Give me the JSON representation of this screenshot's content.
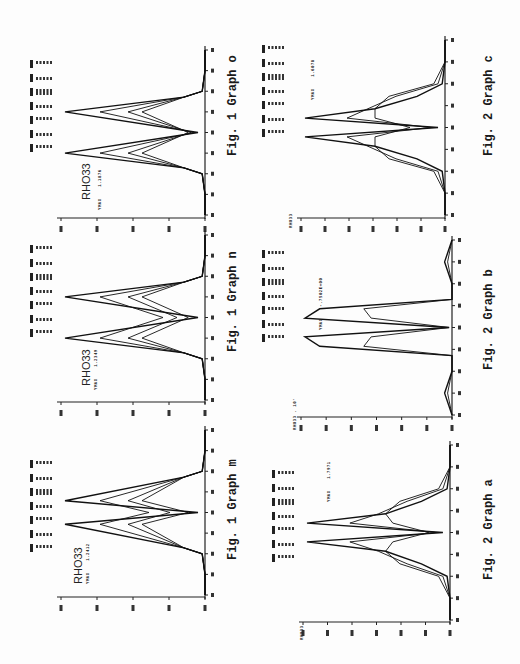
{
  "page": {
    "orientation": "rotated-90-ccw"
  },
  "figures": [
    {
      "id": "fig1-o",
      "caption": "Fig. 1 Graph o",
      "label": "RHO33",
      "value_label": "YMAX",
      "value": "1.1876",
      "x_axis_label": "DM. 10'"
    },
    {
      "id": "fig1-n",
      "caption": "Fig. 1 Graph n",
      "label": "RHO33",
      "value_label": "YMAX",
      "value": "1.2349",
      "x_axis_label": "DM. 10'"
    },
    {
      "id": "fig1-m",
      "caption": "Fig. 1 Graph m",
      "label": "RHO33",
      "value_label": "YMAX",
      "value": "1.2412",
      "x_axis_label": "DM. 10'"
    },
    {
      "id": "fig2-c",
      "caption": "Fig. 2 Graph c",
      "label": "RHO33",
      "value_label": "YMAX",
      "value": "1.6078",
      "x_axis_label": "DM. 10'"
    },
    {
      "id": "fig2-b",
      "caption": "Fig. 2 Graph b",
      "label": "RHO33 . 10'",
      "value_label": "YMAX",
      "value": "-.7502E+00",
      "x_axis_label": "DM. 10'"
    },
    {
      "id": "fig2-a",
      "caption": "Fig. 2 Graph a",
      "label": "RHO33",
      "value_label": "YMAX",
      "value": "1.7971",
      "x_axis_label": "DM. 10'"
    }
  ],
  "chart_data": [
    {
      "type": "line",
      "title": "Fig. 1 Graph o",
      "xlabel": "DM. 10'",
      "ylabel": "RHO33",
      "x": [
        -1.4,
        -1.05,
        -0.7,
        -0.6,
        -0.35,
        0,
        0.35,
        0.6,
        0.7,
        1.05,
        1.4
      ],
      "series": [
        {
          "name": "curve-1",
          "values": [
            0,
            0,
            0.02,
            0.15,
            1.0,
            0.05,
            1.0,
            0.15,
            0.02,
            0,
            0
          ]
        },
        {
          "name": "curve-2",
          "values": [
            0,
            0,
            0.02,
            0.15,
            0.75,
            0.08,
            0.75,
            0.15,
            0.02,
            0,
            0
          ]
        },
        {
          "name": "curve-3",
          "values": [
            0,
            0,
            0.02,
            0.15,
            0.55,
            0.1,
            0.55,
            0.15,
            0.02,
            0,
            0
          ]
        },
        {
          "name": "curve-4",
          "values": [
            0,
            0,
            0.02,
            0.15,
            0.45,
            0.12,
            0.45,
            0.15,
            0.02,
            0,
            0
          ]
        }
      ],
      "ylim": [
        0,
        1.2
      ],
      "grid": false
    },
    {
      "type": "line",
      "title": "Fig. 1 Graph n",
      "xlabel": "DM. 10'",
      "ylabel": "RHO33",
      "x": [
        -1.4,
        -1.05,
        -0.7,
        -0.6,
        -0.35,
        0,
        0.35,
        0.6,
        0.7,
        1.05,
        1.4
      ],
      "series": [
        {
          "name": "curve-1",
          "values": [
            0,
            0,
            0.02,
            0.15,
            1.0,
            0.05,
            1.0,
            0.15,
            0.02,
            0,
            0
          ]
        },
        {
          "name": "curve-2",
          "values": [
            0,
            0,
            0.02,
            0.15,
            0.75,
            0.3,
            0.75,
            0.15,
            0.02,
            0,
            0
          ]
        },
        {
          "name": "curve-3",
          "values": [
            0,
            0,
            0.02,
            0.15,
            0.55,
            0.2,
            0.55,
            0.15,
            0.02,
            0,
            0
          ]
        },
        {
          "name": "curve-4",
          "values": [
            0,
            0,
            0.02,
            0.15,
            0.45,
            0.12,
            0.45,
            0.15,
            0.02,
            0,
            0
          ]
        }
      ],
      "ylim": [
        0,
        1.2
      ],
      "grid": false
    },
    {
      "type": "line",
      "title": "Fig. 1 Graph m",
      "xlabel": "DM. 10'",
      "ylabel": "RHO33",
      "x": [
        -1.4,
        -1.05,
        -0.7,
        -0.6,
        -0.2,
        0,
        0.2,
        0.6,
        0.7,
        1.05,
        1.4
      ],
      "series": [
        {
          "name": "curve-1",
          "values": [
            0,
            0,
            0.02,
            0.15,
            1.0,
            0.05,
            1.0,
            0.15,
            0.02,
            0,
            0
          ]
        },
        {
          "name": "curve-2",
          "values": [
            0,
            0,
            0.02,
            0.15,
            0.75,
            0.4,
            0.75,
            0.15,
            0.02,
            0,
            0
          ]
        },
        {
          "name": "curve-3",
          "values": [
            0,
            0,
            0.02,
            0.15,
            0.55,
            0.25,
            0.55,
            0.15,
            0.02,
            0,
            0
          ]
        },
        {
          "name": "curve-4",
          "values": [
            0,
            0,
            0.02,
            0.15,
            0.45,
            0.12,
            0.45,
            0.15,
            0.02,
            0,
            0
          ]
        }
      ],
      "ylim": [
        0,
        1.2
      ],
      "grid": false
    },
    {
      "type": "line",
      "title": "Fig. 2 Graph c",
      "xlabel": "DM. 10'",
      "ylabel": "RHO33",
      "x": [
        -1.4,
        -1.05,
        -0.7,
        -0.5,
        -0.3,
        -0.15,
        0,
        0.15,
        0.3,
        0.5,
        0.7,
        1.05,
        1.4
      ],
      "series": [
        {
          "name": "curve-1",
          "values": [
            0,
            0,
            0.02,
            0.2,
            0.5,
            1.0,
            0.05,
            1.0,
            0.5,
            0.2,
            0.02,
            0,
            0
          ]
        },
        {
          "name": "curve-2",
          "values": [
            0,
            0,
            0.05,
            0.35,
            0.55,
            0.7,
            0.1,
            0.7,
            0.55,
            0.35,
            0.05,
            0,
            0
          ]
        },
        {
          "name": "curve-3",
          "values": [
            0,
            0,
            0.08,
            0.4,
            0.5,
            0.5,
            0.25,
            0.5,
            0.5,
            0.4,
            0.08,
            0,
            0
          ]
        }
      ],
      "ylim": [
        0,
        1.6
      ],
      "grid": false
    },
    {
      "type": "line",
      "title": "Fig. 2 Graph b",
      "xlabel": "DM. 10'",
      "ylabel": "RHO33 . 10'",
      "x": [
        -1.4,
        -1.05,
        -0.7,
        -0.45,
        -0.3,
        -0.15,
        0,
        0.15,
        0.3,
        0.45,
        0.7,
        1.05,
        1.4
      ],
      "series": [
        {
          "name": "curve-1",
          "values": [
            0,
            0.05,
            0,
            0,
            0.9,
            1.0,
            0.02,
            1.0,
            0.9,
            0,
            0,
            0.05,
            0
          ]
        },
        {
          "name": "curve-2",
          "values": [
            0,
            0.03,
            0,
            0,
            0.6,
            0.55,
            0.02,
            0.55,
            0.6,
            0,
            0,
            0.03,
            0
          ]
        }
      ],
      "ylim": [
        0,
        1.0
      ],
      "grid": false
    },
    {
      "type": "line",
      "title": "Fig. 2 Graph a",
      "xlabel": "DM. 10'",
      "ylabel": "RHO33",
      "x": [
        -1.4,
        -1.05,
        -0.7,
        -0.5,
        -0.3,
        -0.15,
        0,
        0.15,
        0.3,
        0.5,
        0.7,
        1.05,
        1.4
      ],
      "series": [
        {
          "name": "curve-1",
          "values": [
            0,
            0,
            0.02,
            0.2,
            0.45,
            1.0,
            0.05,
            1.0,
            0.45,
            0.2,
            0.02,
            0,
            0
          ]
        },
        {
          "name": "curve-2",
          "values": [
            0,
            0,
            0.05,
            0.3,
            0.5,
            0.7,
            0.1,
            0.7,
            0.5,
            0.3,
            0.05,
            0,
            0
          ]
        },
        {
          "name": "curve-3",
          "values": [
            0,
            0,
            0.08,
            0.35,
            0.45,
            0.4,
            0.15,
            0.4,
            0.45,
            0.35,
            0.08,
            0,
            0
          ]
        }
      ],
      "ylim": [
        0,
        1.8
      ],
      "grid": false
    }
  ]
}
